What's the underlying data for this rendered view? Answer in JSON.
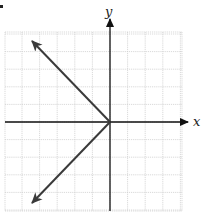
{
  "chart_data": {
    "type": "line",
    "title": "",
    "xlabel": "x",
    "ylabel": "y",
    "grid": true,
    "xlim": [
      -6,
      4
    ],
    "ylim": [
      -5,
      5
    ],
    "series": [
      {
        "name": "upper-ray",
        "points": [
          [
            0,
            0
          ],
          [
            -4.5,
            4.5
          ]
        ],
        "arrow_end": true
      },
      {
        "name": "lower-ray",
        "points": [
          [
            0,
            0
          ],
          [
            -4.5,
            -4.5
          ]
        ],
        "arrow_end": true
      }
    ],
    "legend": null
  },
  "labels": {
    "x_axis": "x",
    "y_axis": "y"
  },
  "colors": {
    "grid": "#c8c8c8",
    "axis": "#111111",
    "line": "#3a3a3a",
    "background": "#ffffff"
  }
}
